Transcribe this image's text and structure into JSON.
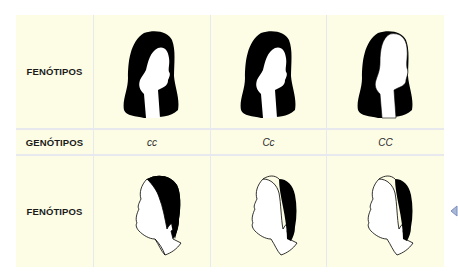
{
  "table": {
    "background_color": "#fdfde6",
    "grid_color": "#e4e7ed",
    "rows": [
      {
        "label": "FENÓTIPOS",
        "type": "phenotype-female",
        "cells": [
          {
            "genotype": "cc",
            "figure": "female-head-full-hair"
          },
          {
            "genotype": "Cc",
            "figure": "female-head-full-hair"
          },
          {
            "genotype": "CC",
            "figure": "female-head-receding-hair"
          }
        ]
      },
      {
        "label": "GENÓTIPOS",
        "type": "genotype",
        "cells": [
          "cc",
          "Cc",
          "CC"
        ]
      },
      {
        "label": "FENÓTIPOS",
        "type": "phenotype-male",
        "cells": [
          {
            "genotype": "cc",
            "figure": "male-head-full-hair"
          },
          {
            "genotype": "Cc",
            "figure": "male-head-bald"
          },
          {
            "genotype": "CC",
            "figure": "male-head-bald"
          }
        ]
      }
    ]
  },
  "nav": {
    "arrow_icon": "left-triangle-icon",
    "arrow_color": "#8a9cc4"
  }
}
